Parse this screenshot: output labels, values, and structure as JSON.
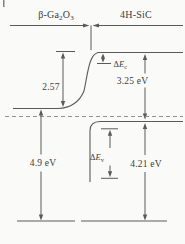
{
  "figure": {
    "type": "energy-band-alignment-diagram",
    "materials": {
      "left": {
        "prefix": "β-Ga",
        "sub1": "2",
        "mid": "O",
        "sub2": "3"
      },
      "right": "4H-SiC"
    },
    "annotations": {
      "band_bending": "2.57",
      "sic_bandgap": "3.25 eV",
      "ga2o3_bandgap": "4.9 eV",
      "valence_band_separation": "4.21 eV",
      "conduction_band_offset": {
        "delta": "Δ",
        "symbol": "E",
        "sub": "c"
      },
      "valence_band_offset": {
        "delta": "Δ",
        "symbol": "E",
        "sub": "v"
      }
    },
    "colors": {
      "line": "#5a5a5a",
      "dashed": "#929292",
      "background": "#fafaf8",
      "text": "#3d3d3d"
    }
  }
}
